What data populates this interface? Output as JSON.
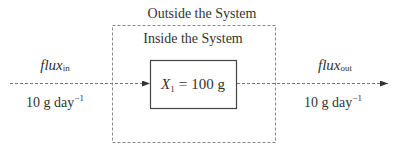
{
  "title_outside": "Outside the System",
  "title_inside": "Inside the System",
  "pool": {
    "symbol": "X",
    "subscript": "1",
    "equals": "=",
    "value": "100 g"
  },
  "flux_in": {
    "name": "flux",
    "subscript": "in",
    "value": "10 g day",
    "exponent": "−1"
  },
  "flux_out": {
    "name": "flux",
    "subscript": "out",
    "value": "10 g day",
    "exponent": "−1"
  },
  "colors": {
    "text": "#333333",
    "line": "#555555",
    "dashed": "#888888"
  }
}
